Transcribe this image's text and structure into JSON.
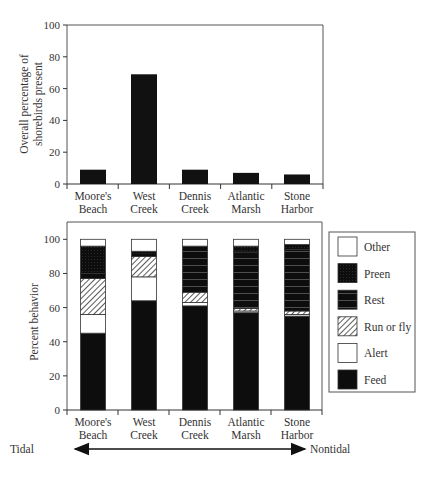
{
  "chart_data": [
    {
      "type": "bar",
      "title": "",
      "xlabel": "",
      "ylabel": "Overall percentage of shorebirds present",
      "ylabel_lines": [
        "Overall percentage of",
        "shorebirds present"
      ],
      "categories": [
        "Moore's Beach",
        "West Creek",
        "Dennis Creek",
        "Atlantic Marsh",
        "Stone Harbor"
      ],
      "category_lines": [
        [
          "Moore's",
          "Beach"
        ],
        [
          "West",
          "Creek"
        ],
        [
          "Dennis",
          "Creek"
        ],
        [
          "Atlantic",
          "Marsh"
        ],
        [
          "Stone",
          "Harbor"
        ]
      ],
      "values": [
        9,
        69,
        9,
        7,
        6
      ],
      "ylim": [
        0,
        100
      ],
      "yticks": [
        0,
        20,
        40,
        60,
        80,
        100
      ],
      "grid": false,
      "color": "#111111"
    },
    {
      "type": "bar",
      "stacked": true,
      "title": "",
      "xlabel": "",
      "ylabel": "Percent behavior",
      "categories": [
        "Moore's Beach",
        "West Creek",
        "Dennis Creek",
        "Atlantic Marsh",
        "Stone Harbor"
      ],
      "category_lines": [
        [
          "Moore's",
          "Beach"
        ],
        [
          "West",
          "Creek"
        ],
        [
          "Dennis",
          "Creek"
        ],
        [
          "Atlantic",
          "Marsh"
        ],
        [
          "Stone",
          "Harbor"
        ]
      ],
      "series": [
        {
          "name": "Feed",
          "pattern": "solid-black",
          "values": [
            45,
            64,
            61,
            57,
            55
          ]
        },
        {
          "name": "Alert",
          "pattern": "white",
          "values": [
            11,
            14,
            2,
            1,
            1
          ]
        },
        {
          "name": "Run or fly",
          "pattern": "diagonal-hatch",
          "values": [
            21,
            12,
            6,
            1.5,
            2
          ]
        },
        {
          "name": "Rest",
          "pattern": "black-horizontal-lines",
          "values": [
            3,
            0,
            27,
            33,
            36
          ]
        },
        {
          "name": "Preen",
          "pattern": "black-crosshatch",
          "values": [
            16,
            3,
            0,
            3.5,
            3
          ]
        },
        {
          "name": "Other",
          "pattern": "white",
          "values": [
            4,
            7,
            4,
            4,
            3
          ]
        }
      ],
      "ylim": [
        0,
        100
      ],
      "yticks": [
        0,
        20,
        40,
        60,
        80,
        100
      ],
      "legend_position": "right",
      "legend_order": [
        "Other",
        "Preen",
        "Rest",
        "Run or fly",
        "Alert",
        "Feed"
      ],
      "gradient_arrow": {
        "left_label": "Tidal",
        "right_label": "Nontidal"
      }
    }
  ],
  "labels": {
    "top_ylabel_1": "Overall percentage of",
    "top_ylabel_2": "shorebirds present",
    "bottom_ylabel": "Percent behavior",
    "tidal": "Tidal",
    "nontidal": "Nontidal",
    "legend": [
      "Other",
      "Preen",
      "Rest",
      "Run or fly",
      "Alert",
      "Feed"
    ]
  }
}
